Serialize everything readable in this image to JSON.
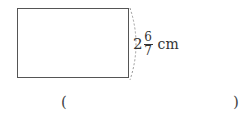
{
  "figure": {
    "shape": "rectangle",
    "side_label": {
      "whole": "2",
      "numerator": "6",
      "denominator": "7",
      "unit": "cm"
    }
  },
  "answer_blank": {
    "open": "(",
    "close": ")",
    "value": ""
  }
}
